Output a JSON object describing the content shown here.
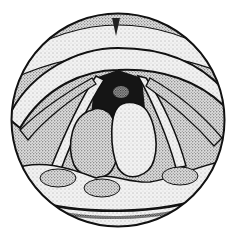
{
  "figure": {
    "colors": {
      "background": "#ffffff",
      "ink": "#111111",
      "stipple_light": "#d9d9d9",
      "stipple_mid": "#a8a8a8",
      "stipple_dark": "#5a5a5a",
      "cavity": "#1a1a1a"
    },
    "viewport": {
      "cx": 118,
      "cy": 120,
      "r": 107
    }
  }
}
